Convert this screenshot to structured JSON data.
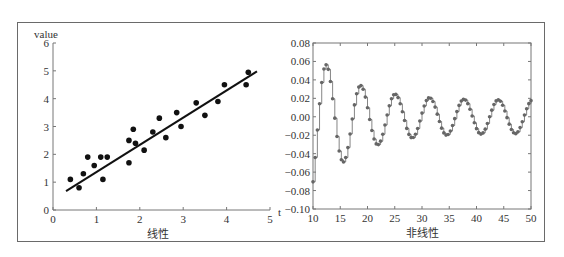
{
  "chart_data": [
    {
      "type": "scatter",
      "title": "",
      "xlabel": "线性",
      "ylabel": "value",
      "x_axis_end_label": "t",
      "xlim": [
        0,
        5
      ],
      "ylim": [
        0,
        6
      ],
      "xticks": [
        0,
        1,
        2,
        3,
        4,
        5
      ],
      "yticks": [
        0,
        1,
        2,
        3,
        4,
        5,
        6
      ],
      "grid": false,
      "points": [
        [
          0.4,
          1.1
        ],
        [
          0.6,
          0.8
        ],
        [
          0.7,
          1.3
        ],
        [
          0.8,
          1.9
        ],
        [
          0.95,
          1.6
        ],
        [
          1.1,
          1.9
        ],
        [
          1.15,
          1.1
        ],
        [
          1.25,
          1.9
        ],
        [
          1.75,
          1.7
        ],
        [
          1.75,
          2.5
        ],
        [
          1.85,
          2.9
        ],
        [
          1.9,
          2.4
        ],
        [
          2.1,
          2.15
        ],
        [
          2.3,
          2.8
        ],
        [
          2.45,
          3.3
        ],
        [
          2.6,
          2.6
        ],
        [
          2.85,
          3.5
        ],
        [
          2.95,
          3.0
        ],
        [
          3.3,
          3.85
        ],
        [
          3.5,
          3.4
        ],
        [
          3.8,
          3.9
        ],
        [
          3.95,
          4.5
        ],
        [
          4.45,
          4.5
        ],
        [
          4.5,
          4.95
        ]
      ],
      "fit_line": {
        "x": [
          0.3,
          4.7
        ],
        "y": [
          0.68,
          4.98
        ]
      },
      "marker_color": "#111111",
      "line_color": "#111111"
    },
    {
      "type": "line",
      "title": "",
      "xlabel": "非线性",
      "ylabel": "",
      "xlim": [
        10,
        50
      ],
      "ylim": [
        -0.1,
        0.08
      ],
      "xticks": [
        10,
        15,
        20,
        25,
        30,
        35,
        40,
        45,
        50
      ],
      "yticks": [
        0.08,
        0.06,
        0.04,
        0.02,
        0.0,
        -0.02,
        -0.04,
        -0.06,
        -0.08,
        -0.1
      ],
      "ytick_labels": [
        "0.08",
        "0.06",
        "0.04",
        "0.02",
        "0.00",
        "−0.02",
        "−0.04",
        "−0.06",
        "−0.08",
        "−0.10"
      ],
      "grid": false,
      "style": "step with markers",
      "description": "Damped oscillation sampled at ~0.4 step, period ~6.3; first peak ≈0.08 near t≈12, troughs ≈-0.063 (t≈16), -0.045 (t≈22), -0.035 (t≈28), -0.029 (t≈34.5), -0.025 (t≈41), -0.021 (t≈47); peaks ≈0.052 (t≈19), 0.039 (t≈25), 0.031 (t≈31), 0.026 (t≈37.5), 0.022 (t≈44)",
      "x_start": 10,
      "x_step": 0.4,
      "line_color": "#777777",
      "marker_color": "#666666"
    }
  ]
}
